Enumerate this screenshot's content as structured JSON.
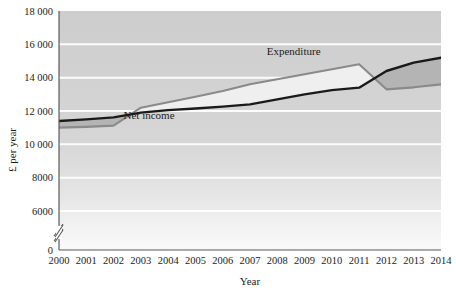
{
  "chart_data": {
    "type": "line",
    "title": "",
    "xlabel": "Year",
    "ylabel": "£ per year",
    "categories": [
      "2000",
      "2001",
      "2002",
      "2003",
      "2004",
      "2005",
      "2006",
      "2007",
      "2008",
      "2009",
      "2010",
      "2011",
      "2012",
      "2013",
      "2014"
    ],
    "x": [
      2000,
      2001,
      2002,
      2003,
      2004,
      2005,
      2006,
      2007,
      2008,
      2009,
      2010,
      2011,
      2012,
      2013,
      2014
    ],
    "series": [
      {
        "name": "Net income",
        "color": "#1a1a1a",
        "values": [
          11400,
          11500,
          11620,
          11900,
          12050,
          12150,
          12260,
          12400,
          12700,
          13000,
          13250,
          13400,
          14400,
          14900,
          15200
        ]
      },
      {
        "name": "Expenditure",
        "color": "#8a8a8a",
        "values": [
          11000,
          11050,
          11120,
          12200,
          12520,
          12860,
          13200,
          13600,
          13900,
          14200,
          14500,
          14800,
          13300,
          13420,
          13600
        ]
      }
    ],
    "ylim": [
      6000,
      18000
    ],
    "y_ticks": [
      18000,
      16000,
      14000,
      12000,
      10000,
      8000,
      6000
    ],
    "y_tick_labels": [
      "18 000",
      "16 000",
      "14 000",
      "12 000",
      "10 000",
      "8000",
      "6000"
    ],
    "y_zero_label": "0",
    "axis_break": true,
    "grid": true,
    "grid_color": "#ffffff",
    "plot_background_top": "#cfcfcf",
    "plot_background_bottom": "#f7f7f7",
    "fill_above_color": "#efefef",
    "fill_below_color": "#b4b4b4",
    "legend": "inline-annotations",
    "annotations": [
      {
        "text": "Net income",
        "x": 2003.3,
        "y": 11540,
        "name": "net-income-series-label"
      },
      {
        "text": "Expenditure",
        "x": 2008.6,
        "y": 15350,
        "name": "expenditure-series-label"
      }
    ]
  }
}
